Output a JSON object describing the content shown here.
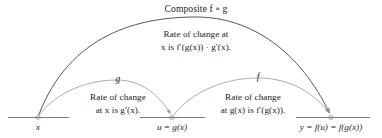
{
  "diagram": {
    "kind": "chain-rule-composite-mapping-diagram",
    "title": "Composite f ∘ g",
    "composite_rate": {
      "line1": "Rate of change at",
      "line2": "x is f′(g(x)) · g′(x)."
    },
    "inner_function": {
      "arc_label": "g",
      "rate_line1": "Rate of change",
      "rate_line2": "at x is g′(x)."
    },
    "outer_function": {
      "arc_label": "f",
      "rate_line1": "Rate of change",
      "rate_line2": "at g(x) is f′(g(x))."
    },
    "number_lines": [
      {
        "name": "domain-line",
        "point_label": "x"
      },
      {
        "name": "intermediate-line",
        "point_label": "u = g(x)"
      },
      {
        "name": "range-line",
        "point_label": "y = f(u) = f(g(x))"
      }
    ],
    "colors": {
      "text": "#1c1c1c",
      "axis": "#7a7a7a",
      "arc_composite": "#4d4d4d",
      "arc_inner": "#a8a8a8",
      "arc_outer": "#a8a8a8",
      "point_marker": "#9a9a9a",
      "background": "#ffffff"
    }
  }
}
